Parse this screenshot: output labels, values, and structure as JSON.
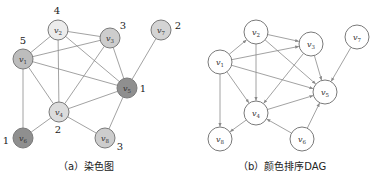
{
  "figure_a": {
    "caption": "（a）染色图",
    "nodes": [
      {
        "id": "v1",
        "label": "v",
        "sub": "1",
        "x": 23,
        "y": 59,
        "color_number": "5",
        "fill": "#bdbdbd",
        "num_x": 23,
        "num_y": 44
      },
      {
        "id": "v2",
        "label": "v",
        "sub": "2",
        "x": 58,
        "y": 30,
        "color_number": "4",
        "fill": "#ececec",
        "num_x": 57,
        "num_y": 14
      },
      {
        "id": "v3",
        "label": "v",
        "sub": "3",
        "x": 110,
        "y": 38,
        "color_number": "3",
        "fill": "#cdcdcd",
        "num_x": 123,
        "num_y": 29
      },
      {
        "id": "v4",
        "label": "v",
        "sub": "4",
        "x": 59,
        "y": 112,
        "color_number": "2",
        "fill": "#dcdcdc",
        "num_x": 58,
        "num_y": 133
      },
      {
        "id": "v5",
        "label": "v",
        "sub": "5",
        "x": 127,
        "y": 88,
        "color_number": "1",
        "fill": "#8f8f8f",
        "num_x": 143,
        "num_y": 92
      },
      {
        "id": "v6",
        "label": "v",
        "sub": "6",
        "x": 23,
        "y": 138,
        "color_number": "1",
        "fill": "#8f8f8f",
        "num_x": 6,
        "num_y": 144
      },
      {
        "id": "v7",
        "label": "v",
        "sub": "7",
        "x": 161,
        "y": 30,
        "color_number": "2",
        "fill": "#d4d4d4",
        "num_x": 178,
        "num_y": 29
      },
      {
        "id": "v8",
        "label": "v",
        "sub": "8",
        "x": 105,
        "y": 138,
        "color_number": "3",
        "fill": "#cdcdcd",
        "num_x": 120,
        "num_y": 150
      }
    ],
    "edges": [
      [
        "v2",
        "v3"
      ],
      [
        "v2",
        "v1"
      ],
      [
        "v2",
        "v4"
      ],
      [
        "v2",
        "v5"
      ],
      [
        "v1",
        "v3"
      ],
      [
        "v1",
        "v5"
      ],
      [
        "v1",
        "v4"
      ],
      [
        "v1",
        "v6"
      ],
      [
        "v3",
        "v5"
      ],
      [
        "v3",
        "v4"
      ],
      [
        "v4",
        "v5"
      ],
      [
        "v4",
        "v6"
      ],
      [
        "v4",
        "v8"
      ],
      [
        "v5",
        "v8"
      ],
      [
        "v7",
        "v5"
      ]
    ]
  },
  "figure_b": {
    "caption": "（b）颜色排序DAG",
    "nodes": [
      {
        "id": "v1",
        "label": "v",
        "sub": "1",
        "x": 220,
        "y": 62
      },
      {
        "id": "v2",
        "label": "v",
        "sub": "2",
        "x": 256,
        "y": 32
      },
      {
        "id": "v3",
        "label": "v",
        "sub": "3",
        "x": 311,
        "y": 44
      },
      {
        "id": "v4",
        "label": "v",
        "sub": "4",
        "x": 256,
        "y": 113
      },
      {
        "id": "v5",
        "label": "v",
        "sub": "5",
        "x": 325,
        "y": 92
      },
      {
        "id": "v6",
        "label": "v",
        "sub": "6",
        "x": 302,
        "y": 139
      },
      {
        "id": "v7",
        "label": "v",
        "sub": "7",
        "x": 357,
        "y": 37
      },
      {
        "id": "v8",
        "label": "v",
        "sub": "8",
        "x": 220,
        "y": 139
      }
    ],
    "edges": [
      [
        "v1",
        "v2"
      ],
      [
        "v1",
        "v3"
      ],
      [
        "v1",
        "v5"
      ],
      [
        "v1",
        "v4"
      ],
      [
        "v1",
        "v8"
      ],
      [
        "v2",
        "v3"
      ],
      [
        "v2",
        "v5"
      ],
      [
        "v2",
        "v4"
      ],
      [
        "v3",
        "v5"
      ],
      [
        "v3",
        "v4"
      ],
      [
        "v7",
        "v5"
      ],
      [
        "v4",
        "v5"
      ],
      [
        "v4",
        "v8"
      ],
      [
        "v6",
        "v4"
      ],
      [
        "v6",
        "v5"
      ]
    ]
  },
  "style": {
    "node_radius_a": 10,
    "node_radius_b": 12,
    "edge_color": "#8a8a8a",
    "node_stroke": "#7a7a7a"
  }
}
